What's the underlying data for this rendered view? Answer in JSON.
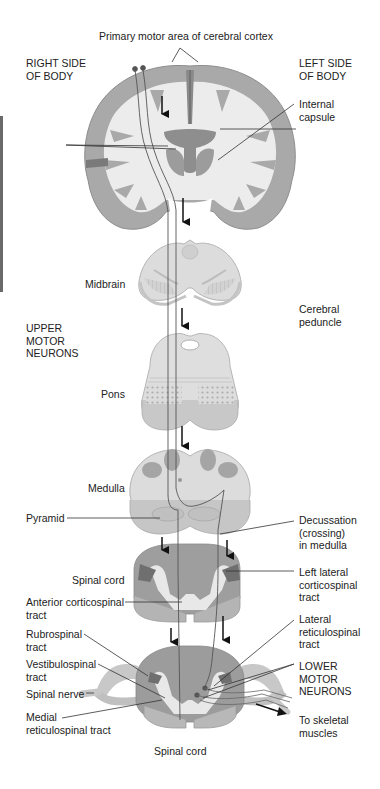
{
  "figure": {
    "colors": {
      "background": "#ffffff",
      "cortex_gray": "#a9a9a9",
      "white_matter": "#ececec",
      "deep_gray": "#8a8a8a",
      "slice_light": "#dcdcdc",
      "slice_edge": "#b4b4b4",
      "spinal_cord": "#9a9a9a",
      "tract_line": "#555555",
      "label_text": "#222222"
    }
  },
  "labels": {
    "primary_motor": "Primary motor area of cerebral cortex",
    "right_side": "RIGHT SIDE\nOF BODY",
    "left_side": "LEFT SIDE\nOF BODY",
    "internal_capsule": "Internal\ncapsule",
    "midbrain": "Midbrain",
    "cerebral_peduncle": "Cerebral\npeduncle",
    "upper_motor_neurons": "UPPER\nMOTOR\nNEURONS",
    "pons": "Pons",
    "medulla": "Medulla",
    "pyramid": "Pyramid",
    "decussation": "Decussation\n(crossing)\nin medulla",
    "spinal_cord_upper": "Spinal cord",
    "anterior_corticospinal": "Anterior corticospinal\ntract",
    "left_lateral_corticospinal": "Left lateral\ncorticospinal\ntract",
    "rubrospinal": "Rubrospinal\ntract",
    "lateral_reticulospinal": "Lateral\nreticulospinal\ntract",
    "vestibulospinal": "Vestibulospinal\ntract",
    "lower_motor_neurons": "LOWER\nMOTOR\nNEURONS",
    "spinal_nerve": "Spinal nerve",
    "medial_reticulospinal": "Medial\nreticulospinal tract",
    "to_skeletal_muscles": "To skeletal\nmuscles",
    "spinal_cord_lower": "Spinal cord"
  }
}
